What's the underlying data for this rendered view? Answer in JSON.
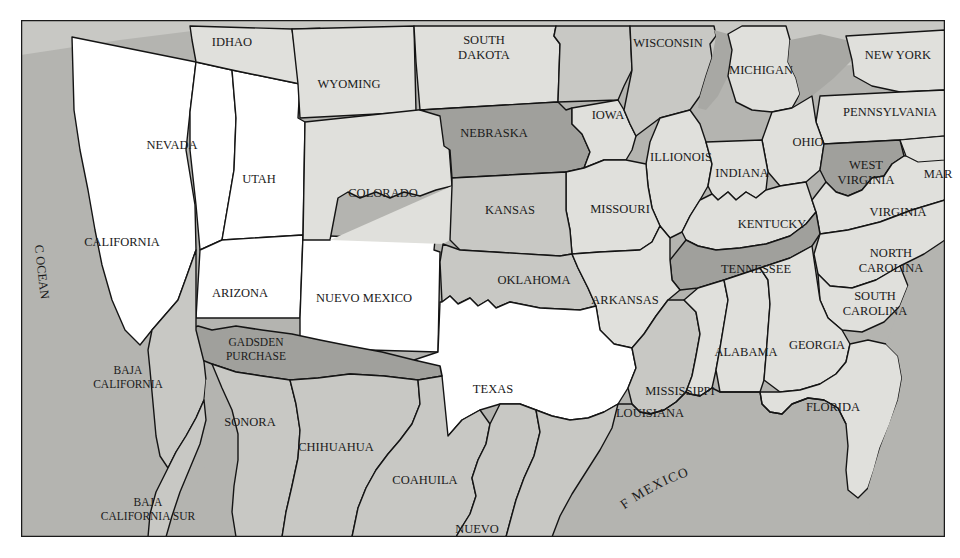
{
  "map": {
    "title": "Map of the United States and northern Mexico showing the Gadsden Purchase",
    "frame": {
      "x": 21,
      "y": 20,
      "width": 924,
      "height": 517,
      "border_color": "#1a1a1a",
      "page_background": "#ffffff"
    },
    "palette": {
      "white": "#ffffff",
      "light_gray": "#e0e0dc",
      "medium_gray": "#c8c8c4",
      "dark_gray": "#a0a09c",
      "ocean_gray": "#b4b4b0",
      "outline": "#141414"
    },
    "legend_note": "Shading distinguishes territories: white = free/western territories and Texas, grays = states and Mexican states, darkest = Gadsden Purchase",
    "water_labels": [
      {
        "name": "pacific-ocean-label",
        "text": "PACIFIC OCEAN",
        "orientation": "vertical-curved"
      },
      {
        "name": "gulf-of-mexico-label",
        "text": "GULF OF MEXICO",
        "orientation": "arced"
      }
    ],
    "regions": [
      {
        "id": "idaho",
        "label": "IDHAO",
        "shade": "light_gray",
        "cx": 232,
        "cy": 43,
        "lines": [
          "IDHAO"
        ]
      },
      {
        "id": "wyoming",
        "label": "WYOMING",
        "shade": "light_gray",
        "cx": 349,
        "cy": 85,
        "lines": [
          "WYOMING"
        ]
      },
      {
        "id": "south-dakota",
        "label": "SOUTH DAKOTA",
        "shade": "light_gray",
        "cx": 484,
        "cy": 49,
        "lines": [
          "SOUTH",
          "DAKOTA"
        ]
      },
      {
        "id": "wisconsin",
        "label": "WISCONSIN",
        "shade": "medium_gray",
        "cx": 668,
        "cy": 44,
        "lines": [
          "WISCONSIN"
        ]
      },
      {
        "id": "michigan",
        "label": "MICHIGAN",
        "shade": "light_gray",
        "cx": 761,
        "cy": 71,
        "lines": [
          "MICHIGAN"
        ]
      },
      {
        "id": "new-york",
        "label": "NEW YORK",
        "shade": "light_gray",
        "cx": 898,
        "cy": 56,
        "lines": [
          "NEW YORK"
        ]
      },
      {
        "id": "pennsylvania",
        "label": "PENNSYLVANIA",
        "shade": "light_gray",
        "cx": 890,
        "cy": 113,
        "lines": [
          "PENNSYLVANIA"
        ]
      },
      {
        "id": "ohio",
        "label": "OHIO",
        "shade": "light_gray",
        "cx": 808,
        "cy": 143,
        "lines": [
          "OHIO"
        ]
      },
      {
        "id": "iowa",
        "label": "IOWA",
        "shade": "light_gray",
        "cx": 608,
        "cy": 116,
        "lines": [
          "IOWA"
        ]
      },
      {
        "id": "nebraska",
        "label": "NEBRASKA",
        "shade": "dark_gray",
        "cx": 494,
        "cy": 134,
        "lines": [
          "NEBRASKA"
        ]
      },
      {
        "id": "nevada",
        "label": "NEVADA",
        "shade": "white",
        "cx": 172,
        "cy": 146,
        "lines": [
          "NEVADA"
        ]
      },
      {
        "id": "utah",
        "label": "UTAH",
        "shade": "white",
        "cx": 259,
        "cy": 180,
        "lines": [
          "UTAH"
        ]
      },
      {
        "id": "colorado",
        "label": "COLORADO",
        "shade": "light_gray",
        "cx": 383,
        "cy": 194,
        "lines": [
          "COLORADO"
        ]
      },
      {
        "id": "illinois",
        "label": "ILLIONOIS",
        "shade": "light_gray",
        "cx": 681,
        "cy": 158,
        "lines": [
          "ILLIONOIS"
        ]
      },
      {
        "id": "indiana",
        "label": "INDIANA",
        "shade": "light_gray",
        "cx": 742,
        "cy": 174,
        "lines": [
          "INDIANA"
        ]
      },
      {
        "id": "west-virginia",
        "label": "WEST VIRGINIA",
        "shade": "dark_gray",
        "cx": 866,
        "cy": 174,
        "lines": [
          "WEST",
          "VIRGINIA"
        ]
      },
      {
        "id": "virginia",
        "label": "VIRGINIA",
        "shade": "light_gray",
        "cx": 898,
        "cy": 213,
        "lines": [
          "VIRGINIA"
        ]
      },
      {
        "id": "maryland",
        "label": "MAR",
        "shade": "light_gray",
        "cx": 938,
        "cy": 175,
        "lines": [
          "MAR"
        ]
      },
      {
        "id": "kansas",
        "label": "KANSAS",
        "shade": "medium_gray",
        "cx": 510,
        "cy": 211,
        "lines": [
          "KANSAS"
        ]
      },
      {
        "id": "missouri",
        "label": "MISSOURI",
        "shade": "light_gray",
        "cx": 620,
        "cy": 210,
        "lines": [
          "MISSOURI"
        ]
      },
      {
        "id": "kentucky",
        "label": "KENTUCKY",
        "shade": "light_gray",
        "cx": 772,
        "cy": 225,
        "lines": [
          "KENTUCKY"
        ]
      },
      {
        "id": "california",
        "label": "CALIFORNIA",
        "shade": "white",
        "cx": 122,
        "cy": 243,
        "lines": [
          "CALIFORNIA"
        ]
      },
      {
        "id": "tennessee",
        "label": "TENNESSEE",
        "shade": "dark_gray",
        "cx": 756,
        "cy": 270,
        "lines": [
          "TENNESSEE"
        ]
      },
      {
        "id": "north-carolina",
        "label": "NORTH CAROLINA",
        "shade": "light_gray",
        "cx": 891,
        "cy": 262,
        "lines": [
          "NORTH",
          "CAROLINA"
        ]
      },
      {
        "id": "oklahoma",
        "label": "OKLAHOMA",
        "shade": "medium_gray",
        "cx": 534,
        "cy": 281,
        "lines": [
          "OKLAHOMA"
        ]
      },
      {
        "id": "arkansas",
        "label": "ARKANSAS",
        "shade": "light_gray",
        "cx": 625,
        "cy": 301,
        "lines": [
          "ARKANSAS"
        ]
      },
      {
        "id": "south-carolina",
        "label": "SOUTH CAROLINA",
        "shade": "light_gray",
        "cx": 875,
        "cy": 305,
        "lines": [
          "SOUTH",
          "CAROLINA"
        ]
      },
      {
        "id": "arizona",
        "label": "ARIZONA",
        "shade": "white",
        "cx": 240,
        "cy": 294,
        "lines": [
          "ARIZONA"
        ]
      },
      {
        "id": "nuevo-mexico",
        "label": "NUEVO MEXICO",
        "shade": "white",
        "cx": 364,
        "cy": 299,
        "lines": [
          "NUEVO MEXICO"
        ]
      },
      {
        "id": "gadsden-purchase",
        "label": "GADSDEN PURCHASE",
        "shade": "dark_gray",
        "cx": 256,
        "cy": 350,
        "lines": [
          "GADSDEN",
          "PURCHASE"
        ]
      },
      {
        "id": "alabama",
        "label": "ALABAMA",
        "shade": "light_gray",
        "cx": 746,
        "cy": 353,
        "lines": [
          "ALABAMA"
        ]
      },
      {
        "id": "georgia",
        "label": "GEORGIA",
        "shade": "light_gray",
        "cx": 817,
        "cy": 346,
        "lines": [
          "GEORGIA"
        ]
      },
      {
        "id": "texas",
        "label": "TEXAS",
        "shade": "white",
        "cx": 493,
        "cy": 390,
        "lines": [
          "TEXAS"
        ]
      },
      {
        "id": "baja-california",
        "label": "BAJA CALIFORNIA",
        "shade": "medium_gray",
        "cx": 128,
        "cy": 378,
        "lines": [
          "BAJA",
          "CALIFORNIA"
        ]
      },
      {
        "id": "sonora",
        "label": "SONORA",
        "shade": "medium_gray",
        "cx": 250,
        "cy": 423,
        "lines": [
          "SONORA"
        ]
      },
      {
        "id": "chihuahua",
        "label": "CHIHUAHUA",
        "shade": "medium_gray",
        "cx": 336,
        "cy": 448,
        "lines": [
          "CHIHUAHUA"
        ]
      },
      {
        "id": "mississippi",
        "label": "MISSISSIPPI",
        "shade": "light_gray",
        "cx": 680,
        "cy": 392,
        "lines": [
          "MISSISSIPPI"
        ]
      },
      {
        "id": "louisiana",
        "label": "LOUISIANA",
        "shade": "medium_gray",
        "cx": 650,
        "cy": 414,
        "lines": [
          "LOUISIANA"
        ]
      },
      {
        "id": "florida",
        "label": "FLORIDA",
        "shade": "light_gray",
        "cx": 833,
        "cy": 408,
        "lines": [
          "FLORIDA"
        ]
      },
      {
        "id": "coahuila",
        "label": "COAHUILA",
        "shade": "medium_gray",
        "cx": 425,
        "cy": 481,
        "lines": [
          "COAHUILA"
        ]
      },
      {
        "id": "baja-california-sur",
        "label": "BAJA CALIFORNIA SUR",
        "shade": "medium_gray",
        "cx": 148,
        "cy": 510,
        "lines": [
          "BAJA",
          "CALIFORNIA SUR"
        ]
      },
      {
        "id": "nuevo-leon",
        "label": "NUEVO",
        "shade": "medium_gray",
        "cx": 477,
        "cy": 530,
        "lines": [
          "NUEVO"
        ]
      }
    ]
  }
}
